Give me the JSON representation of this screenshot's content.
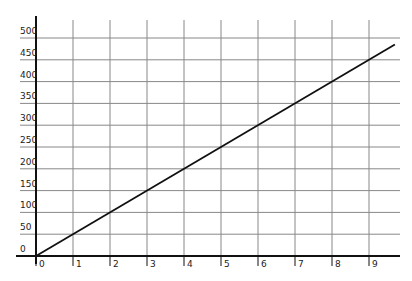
{
  "chart_data": {
    "type": "line",
    "title": "",
    "xlabel": "",
    "ylabel": "",
    "x": [
      0,
      1,
      2,
      3,
      4,
      5,
      6,
      7,
      8,
      9
    ],
    "series": [
      {
        "name": "line",
        "values": [
          0,
          50,
          100,
          150,
          200,
          250,
          300,
          350,
          400,
          450
        ]
      }
    ],
    "xticks": [
      "0",
      "1",
      "2",
      "3",
      "4",
      "5",
      "6",
      "7",
      "8",
      "9"
    ],
    "yticks": [
      "0",
      "50",
      "100",
      "150",
      "200",
      "250",
      "300",
      "350",
      "400",
      "450",
      "500"
    ],
    "xlim": [
      0,
      9.7
    ],
    "ylim": [
      0,
      500
    ],
    "grid": true,
    "legend": null
  }
}
